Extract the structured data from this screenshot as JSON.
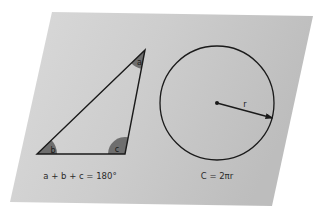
{
  "diagram": {
    "type": "geometry-illustration",
    "background_card": {
      "shape": "parallelogram",
      "fill": "#c9c9c9",
      "fill_light": "#d8d8d8",
      "corners": [
        [
          52,
          12
        ],
        [
          313,
          16
        ],
        [
          272,
          206
        ],
        [
          10,
          202
        ]
      ]
    },
    "triangle": {
      "vertices": {
        "a": [
          145,
          50
        ],
        "b": [
          37,
          154
        ],
        "c": [
          125,
          154
        ]
      },
      "stroke": "#1a1a1a",
      "angle_fill": "#6e6e6e",
      "angles": [
        {
          "id": "a",
          "label": "a"
        },
        {
          "id": "b",
          "label": "b"
        },
        {
          "id": "c",
          "label": "c"
        }
      ],
      "formula": "a + b + c = 180°"
    },
    "circle": {
      "center": [
        217,
        103
      ],
      "radius": 57,
      "stroke": "#1a1a1a",
      "radius_label": "r",
      "formula": "C = 2πr"
    }
  }
}
